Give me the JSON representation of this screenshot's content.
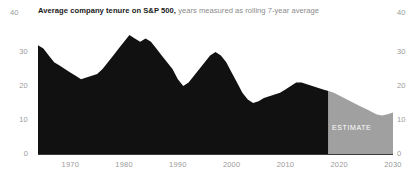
{
  "title": {
    "main": "Average company tenure on S&P 500,",
    "sub": " years measured as rolling 7-year average"
  },
  "annotations": {
    "estimate_label": "ESTIMATE"
  },
  "axis": {
    "y_top_left": "40",
    "y_top_right": "40",
    "y_ticks": [
      "30",
      "20",
      "10",
      "0"
    ],
    "x_ticks": [
      "1970",
      "1980",
      "1990",
      "2000",
      "2010",
      "2020",
      "2030"
    ]
  },
  "colors": {
    "actual": "#111111",
    "estimate": "#a0a0a0",
    "axis_text": "#9a9a9a",
    "axis_line": "#3a3a3a",
    "title_main": "#1a1a1a",
    "title_sub": "#8c8c8c",
    "estimate_text": "#ffffff",
    "background": "#ffffff"
  },
  "chart_data": {
    "type": "area",
    "title": "Average company tenure on S&P 500, years measured as rolling 7-year average",
    "xlabel": "",
    "ylabel": "",
    "xlim": [
      1964,
      2030
    ],
    "ylim": [
      0,
      40
    ],
    "grid": false,
    "legend": null,
    "estimate_start_year": 2018,
    "series": [
      {
        "name": "Average company tenure (actual)",
        "color": "#111111",
        "x": [
          1964,
          1965,
          1966,
          1967,
          1968,
          1969,
          1970,
          1971,
          1972,
          1973,
          1974,
          1975,
          1976,
          1977,
          1978,
          1979,
          1980,
          1981,
          1982,
          1983,
          1984,
          1985,
          1986,
          1987,
          1988,
          1989,
          1990,
          1991,
          1992,
          1993,
          1994,
          1995,
          1996,
          1997,
          1998,
          1999,
          2000,
          2001,
          2002,
          2003,
          2004,
          2005,
          2006,
          2007,
          2008,
          2009,
          2010,
          2011,
          2012,
          2013,
          2014,
          2015,
          2016,
          2017,
          2018
        ],
        "values": [
          32,
          31,
          29,
          27,
          26,
          25,
          24,
          23,
          22,
          22.5,
          23,
          23.5,
          25,
          27,
          29,
          31,
          33,
          35,
          34,
          33,
          34,
          33,
          31,
          29,
          27,
          25,
          22,
          20,
          21,
          23,
          25,
          27,
          29,
          30,
          29,
          27,
          24,
          21,
          18,
          16,
          15,
          15.5,
          16.5,
          17,
          17.5,
          18,
          19,
          20,
          21,
          21,
          20.5,
          20,
          19.5,
          19,
          18.5
        ]
      },
      {
        "name": "Average company tenure (estimate)",
        "color": "#a0a0a0",
        "x": [
          2018,
          2019,
          2020,
          2021,
          2022,
          2023,
          2024,
          2025,
          2026,
          2027,
          2028,
          2029,
          2030
        ],
        "values": [
          18.5,
          18,
          17.2,
          16.4,
          15.6,
          14.8,
          14,
          13.2,
          12.4,
          11.6,
          11.3,
          11.7,
          12.2
        ]
      }
    ]
  }
}
